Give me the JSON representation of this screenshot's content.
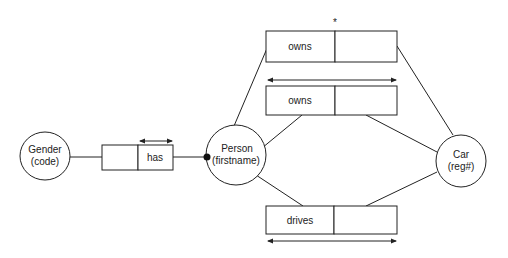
{
  "diagram": {
    "type": "ORM fact-type diagram",
    "entities": [
      {
        "id": "gender",
        "name": "Gender",
        "ref": "(code)"
      },
      {
        "id": "person",
        "name": "Person",
        "ref": "(firstname)"
      },
      {
        "id": "car",
        "name": "Car",
        "ref": "(reg#)"
      }
    ],
    "facts": [
      {
        "id": "has",
        "label": "has",
        "roles": [
          "Person",
          "Gender"
        ],
        "uniqueness": "single-role"
      },
      {
        "id": "owns_top",
        "label": "owns",
        "roles": [
          "Person",
          "Car"
        ],
        "marker": "*"
      },
      {
        "id": "owns_mid",
        "label": "owns",
        "roles": [
          "Person",
          "Car"
        ],
        "uniqueness": "spanning"
      },
      {
        "id": "drives",
        "label": "drives",
        "roles": [
          "Person",
          "Car"
        ],
        "uniqueness": "spanning"
      }
    ],
    "mandatory_dot_on": "Person (has)",
    "colors": {
      "stroke": "#222222",
      "background": "#ffffff"
    }
  }
}
